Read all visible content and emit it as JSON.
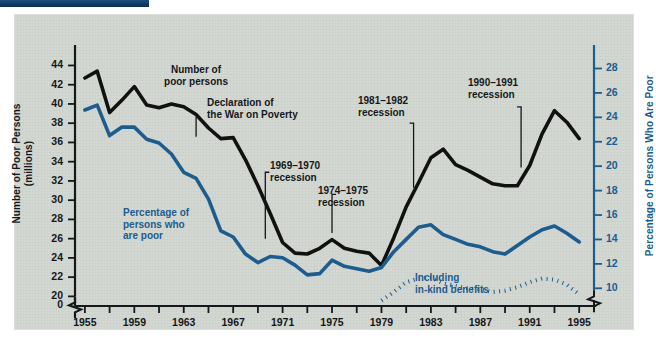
{
  "figure": {
    "background_color": "#d4d8d2",
    "accent_bar_color": "#123a63",
    "series_black_color": "#111111",
    "series_blue_color": "#1d5c8e"
  },
  "axes": {
    "left": {
      "title": "Number of Poor Persons\n(millions)",
      "ticks": [
        44,
        42,
        40,
        38,
        36,
        34,
        32,
        30,
        28,
        26,
        24,
        22,
        20
      ],
      "zero_label": "0",
      "has_break": true,
      "range": [
        20,
        45
      ]
    },
    "right": {
      "title": "Percentage of Persons Who Are Poor",
      "ticks": [
        28,
        26,
        24,
        22,
        20,
        18,
        16,
        14,
        12,
        10
      ],
      "has_break": true,
      "range": [
        9,
        29
      ]
    },
    "bottom": {
      "labels": [
        "1955",
        "1959",
        "1963",
        "1967",
        "1971",
        "1975",
        "1979",
        "1983",
        "1987",
        "1991",
        "1995"
      ],
      "tick_years": [
        1955,
        1957,
        1959,
        1961,
        1963,
        1965,
        1967,
        1969,
        1971,
        1973,
        1975,
        1977,
        1979,
        1981,
        1983,
        1985,
        1987,
        1989,
        1991,
        1993,
        1995
      ],
      "range": [
        1954,
        1996
      ]
    }
  },
  "annotations": [
    {
      "id": "number-poor-persons",
      "text": "Number of\npoor persons",
      "color": "black"
    },
    {
      "id": "declaration-war-poverty",
      "text": "Declaration of\nthe War on Poverty",
      "color": "black"
    },
    {
      "id": "recession-1969-1970",
      "text": "1969–1970\nrecession",
      "color": "black"
    },
    {
      "id": "recession-1974-1975",
      "text": "1974–1975\nrecession",
      "color": "black"
    },
    {
      "id": "recession-1981-1982",
      "text": "1981–1982\nrecession",
      "color": "black"
    },
    {
      "id": "recession-1990-1991",
      "text": "1990–1991\nrecession",
      "color": "black"
    },
    {
      "id": "percentage-persons-poor",
      "text": "Percentage of\npersons who\nare poor",
      "color": "blue"
    },
    {
      "id": "including-in-kind-benefits",
      "text": "Including\nin-kind benefits",
      "color": "blue"
    }
  ],
  "chart_data": {
    "type": "line",
    "title": "",
    "xlabel": "",
    "ylabel": "Number of Poor Persons (millions)",
    "y2label": "Percentage of Persons Who Are Poor",
    "xlim": [
      1954,
      1996
    ],
    "ylim": [
      20,
      45
    ],
    "y2lim": [
      9,
      29
    ],
    "grid": false,
    "legend": "annotations on plot",
    "x": [
      1955,
      1956,
      1957,
      1958,
      1959,
      1960,
      1961,
      1962,
      1963,
      1964,
      1965,
      1966,
      1967,
      1968,
      1969,
      1970,
      1971,
      1972,
      1973,
      1974,
      1975,
      1976,
      1977,
      1978,
      1979,
      1980,
      1981,
      1982,
      1983,
      1984,
      1985,
      1986,
      1987,
      1988,
      1989,
      1990,
      1991,
      1992,
      1993,
      1994,
      1995
    ],
    "series": [
      {
        "name": "Number of poor persons",
        "axis": "left",
        "units": "millions",
        "style": "solid",
        "color": "#111111",
        "values": [
          42.7,
          43.4,
          39.1,
          40.4,
          41.8,
          39.9,
          39.6,
          40.0,
          39.7,
          38.9,
          37.5,
          36.4,
          36.5,
          34.2,
          31.5,
          28.6,
          25.6,
          24.5,
          24.4,
          25.0,
          25.9,
          25.0,
          24.7,
          24.5,
          23.2,
          26.1,
          29.3,
          31.8,
          34.4,
          35.3,
          33.7,
          33.1,
          32.4,
          31.7,
          31.5,
          31.5,
          33.6,
          36.9,
          39.3,
          38.1,
          36.4
        ]
      },
      {
        "name": "Percentage of persons who are poor",
        "axis": "right",
        "units": "percent",
        "style": "solid",
        "color": "#1d5c8e",
        "values": [
          24.6,
          25.0,
          22.5,
          23.2,
          23.2,
          22.2,
          21.9,
          21.0,
          19.5,
          19.0,
          17.3,
          14.7,
          14.2,
          12.8,
          12.1,
          12.6,
          12.5,
          11.9,
          11.1,
          11.2,
          12.3,
          11.8,
          11.6,
          11.4,
          11.7,
          13.0,
          14.0,
          15.0,
          15.2,
          14.4,
          14.0,
          13.6,
          13.4,
          13.0,
          12.8,
          13.5,
          14.2,
          14.8,
          15.1,
          14.5,
          13.8
        ]
      },
      {
        "name": "Including in-kind benefits",
        "axis": "right",
        "units": "percent",
        "style": "dotted",
        "color": "#1d5c8e",
        "start_year": 1979,
        "values_from_1979": [
          9.0,
          9.7,
          10.5,
          10.8,
          10.9,
          10.4,
          10.2,
          10.0,
          9.9,
          9.7,
          9.8,
          10.1,
          10.5,
          10.8,
          10.7,
          10.3,
          9.5
        ]
      }
    ]
  }
}
